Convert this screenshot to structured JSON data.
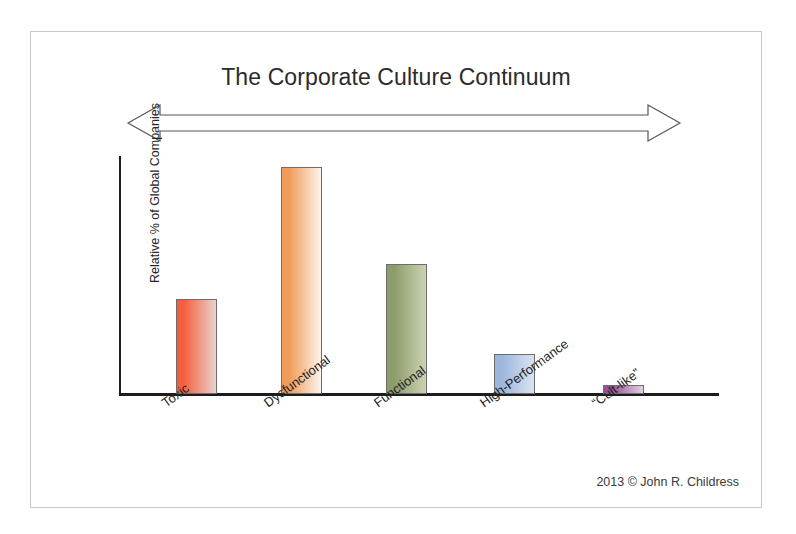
{
  "slide": {
    "title": "The Corporate Culture Continuum",
    "credit": "2013 © John R. Childress",
    "arrow_name": "double-headed-continuum-arrow"
  },
  "chart_data": {
    "type": "bar",
    "title": "The Corporate Culture Continuum",
    "categories": [
      "Toxic",
      "Dysfunctional",
      "Functional",
      "High-Performance",
      "“Cult-like”"
    ],
    "values": [
      40,
      96,
      55,
      17,
      4
    ],
    "xlabel": "",
    "ylabel": "Relative % of Global Companies",
    "ylim": [
      0,
      100
    ],
    "grid": false,
    "legend": false,
    "axis_ticks": false,
    "bar_colors": [
      "#F4603F",
      "#F09B5A",
      "#8D9C6B",
      "#9DB6DB",
      "#9B4F96"
    ],
    "bar_fade_colors": [
      "#EBD2CB",
      "#FDF4EC",
      "#CBD2B1",
      "#D9E3F1",
      "#E2CFE2"
    ],
    "bar_border_color": "#6d6d6d",
    "axis_color": "#1d1d1d",
    "gradient_direction": "left-to-right-fade"
  },
  "bars": [
    {
      "label": "Toxic",
      "value": 40,
      "left": 57,
      "height_px": 95,
      "color": "#F4603F",
      "fade": "#EBD2CB"
    },
    {
      "label": "Dysfunctional",
      "value": 96,
      "left": 162,
      "height_px": 227,
      "color": "#F09B5A",
      "fade": "#FDF4EC"
    },
    {
      "label": "Functional",
      "value": 55,
      "left": 267,
      "height_px": 130,
      "color": "#8D9C6B",
      "fade": "#CBD2B1"
    },
    {
      "label": "High-Performance",
      "value": 17,
      "left": 375,
      "height_px": 40,
      "color": "#9DB6DB",
      "fade": "#D9E3F1"
    },
    {
      "label": "“Cult-like”",
      "value": 4,
      "left": 484,
      "height_px": 9,
      "color": "#9B4F96",
      "fade": "#E2CFE2"
    }
  ],
  "x_label_positions": [
    40,
    142,
    252,
    358,
    470
  ]
}
